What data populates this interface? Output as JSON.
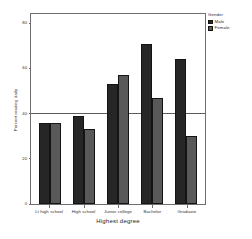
{
  "chart_data": {
    "type": "bar",
    "title": "",
    "xlabel": "Highest degree",
    "ylabel": "Percent reading daily",
    "categories": [
      "Lt high school",
      "High school",
      "Junior college",
      "Bachelor",
      "Graduate"
    ],
    "series": [
      {
        "name": "Male",
        "color": "#262626",
        "values": [
          36,
          39,
          53,
          71,
          64
        ]
      },
      {
        "name": "Female",
        "color": "#595959",
        "values": [
          36,
          33,
          57,
          47,
          30
        ]
      }
    ],
    "ylim": [
      0,
      85
    ],
    "yticks": [
      0,
      20,
      40,
      60,
      80
    ],
    "ytick_labels": [
      "0",
      "20",
      "40",
      "60",
      "80"
    ],
    "grid": false,
    "reference_line": 40,
    "legend": {
      "title": "Gender",
      "position": "right"
    }
  },
  "legend": {
    "title": "Gender",
    "entries": [
      {
        "label": "Male"
      },
      {
        "label": "Female"
      }
    ]
  },
  "axes": {
    "x_title": "Highest degree",
    "y_title": "Percent reading daily"
  }
}
